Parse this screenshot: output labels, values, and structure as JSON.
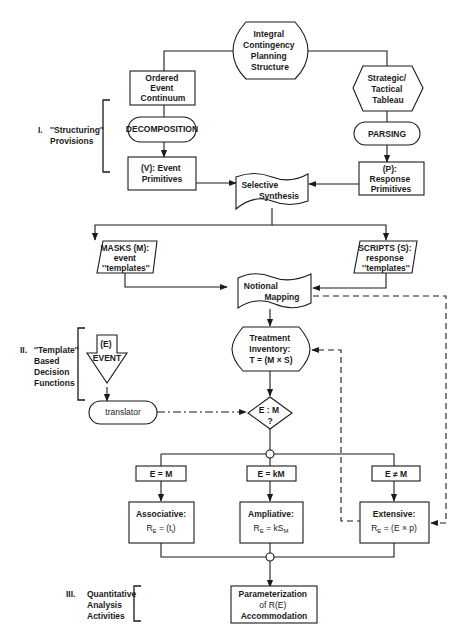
{
  "nodes": {
    "root": [
      "Integral",
      "Contingency",
      "Planning",
      "Structure"
    ],
    "ordered_event": [
      "Ordered",
      "Event",
      "Continuum"
    ],
    "strategic": [
      "Strategic/",
      "Tactical",
      "Tableau"
    ],
    "decomposition": [
      "DECOMPOSITION"
    ],
    "parsing": [
      "PARSING"
    ],
    "event_primitives": [
      "(V): Event",
      "Primitives"
    ],
    "response_primitives": [
      "(P):",
      "Response",
      "Primitives"
    ],
    "selective_synthesis": [
      "Selective",
      "Synthesis"
    ],
    "masks": [
      "MASKS (M):",
      "event",
      "''templates''"
    ],
    "scripts": [
      "SCRIPTS (S):",
      "response",
      "''templates''"
    ],
    "notional_mapping": [
      "Notional",
      "Mapping"
    ],
    "treatment_inventory": [
      "Treatment",
      "Inventory:",
      "T = (M × S)"
    ],
    "event_input": [
      "(E)",
      "EVENT"
    ],
    "translator": [
      "translator"
    ],
    "decision": [
      "E : M",
      "?"
    ],
    "cond_equal": [
      "E = M"
    ],
    "cond_km": [
      "E = kM"
    ],
    "cond_not_equal": [
      "E ≠ M"
    ],
    "associative": [
      "Associative:",
      "R",
      "E",
      " = (t",
      "i",
      ")"
    ],
    "ampliative": [
      "Ampliative:",
      "R",
      "E",
      " = kS",
      "M"
    ],
    "extensive": [
      "Extensive:",
      "R",
      "E",
      " = (E × p)"
    ],
    "parameterization": [
      "Parameterization",
      "of R(E)",
      "Accommodation"
    ]
  },
  "side_labels": {
    "section1": [
      "I.",
      "''Structuring''",
      "Provisions"
    ],
    "section2": [
      "II.",
      "''Template''",
      "Based",
      "Decision",
      "Functions"
    ],
    "section3": [
      "III.",
      "Quantitative",
      "Analysis",
      "Activities"
    ]
  }
}
